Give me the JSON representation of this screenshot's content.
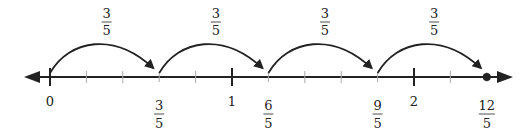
{
  "diagram": {
    "type": "number-line-jumps",
    "axis": {
      "min_fifths": 0,
      "max_fifths": 12,
      "whole_labels": [
        {
          "value_fifths": 0,
          "label": "0"
        },
        {
          "value_fifths": 5,
          "label": "1"
        },
        {
          "value_fifths": 10,
          "label": "2"
        }
      ],
      "fraction_labels": [
        {
          "value_fifths": 3,
          "num": "3",
          "den": "5"
        },
        {
          "value_fifths": 6,
          "num": "6",
          "den": "5"
        },
        {
          "value_fifths": 9,
          "num": "9",
          "den": "5"
        },
        {
          "value_fifths": 12,
          "num": "12",
          "den": "5"
        }
      ],
      "endpoint_dot_fifths": 12
    },
    "jumps": [
      {
        "from_fifths": 0,
        "to_fifths": 3,
        "num": "3",
        "den": "5"
      },
      {
        "from_fifths": 3,
        "to_fifths": 6,
        "num": "3",
        "den": "5"
      },
      {
        "from_fifths": 6,
        "to_fifths": 9,
        "num": "3",
        "den": "5"
      },
      {
        "from_fifths": 9,
        "to_fifths": 12,
        "num": "3",
        "den": "5"
      }
    ],
    "colors": {
      "line": "#222222",
      "text": "#222222"
    }
  }
}
